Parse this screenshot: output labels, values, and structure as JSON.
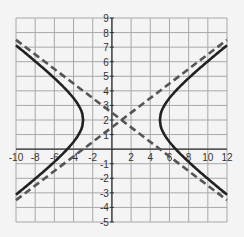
{
  "chart_data": {
    "type": "line",
    "title": "",
    "xlabel": "",
    "ylabel": "",
    "xlim": [
      -10,
      12
    ],
    "ylim": [
      -5,
      9
    ],
    "grid": true,
    "grid_x_step": 2,
    "grid_y_step": 1,
    "x_ticks": [
      -10,
      -8,
      -6,
      -4,
      -2,
      2,
      4,
      6,
      8,
      10,
      12
    ],
    "y_ticks": [
      9,
      8,
      7,
      6,
      5,
      4,
      3,
      2,
      1,
      -1,
      -2,
      -3,
      -4,
      -5
    ],
    "series": [
      {
        "name": "hyperbola",
        "style": "solid",
        "equation": "(x-1)^2/16 - (y-2)^2/4 = 1",
        "center": [
          1,
          2
        ],
        "a": 4,
        "b": 2,
        "vertices": [
          [
            -3,
            2
          ],
          [
            5,
            2
          ]
        ],
        "color": "#222222"
      },
      {
        "name": "asymptote-1",
        "style": "dashed",
        "equation": "y = 0.5(x-1) + 2",
        "points": [
          [
            -10,
            -3.5
          ],
          [
            12,
            7.5
          ]
        ],
        "color": "#555555"
      },
      {
        "name": "asymptote-2",
        "style": "dashed",
        "equation": "y = -0.5(x-1) + 2",
        "points": [
          [
            -10,
            7.5
          ],
          [
            12,
            -3.5
          ]
        ],
        "color": "#555555"
      }
    ]
  }
}
